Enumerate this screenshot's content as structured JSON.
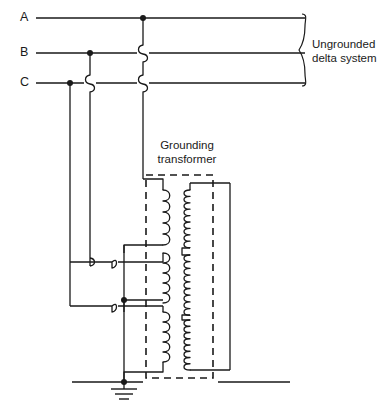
{
  "diagram": {
    "type": "electrical-schematic",
    "canvas": {
      "width": 390,
      "height": 406
    },
    "phases": [
      {
        "label": "A",
        "y": 18,
        "x_label": 22,
        "tap_x": 143
      },
      {
        "label": "B",
        "y": 53,
        "x_label": 22,
        "tap_x": 90
      },
      {
        "label": "C",
        "y": 83,
        "x_label": 22,
        "tap_x": 70
      }
    ],
    "bus": {
      "x_start": 36,
      "x_end": 305
    },
    "system_label": {
      "line1": "Ungrounded",
      "line2": "delta system"
    },
    "transformer_label": {
      "line1": "Grounding",
      "line2": "transformer"
    },
    "dashed_box": {
      "x": 146,
      "y": 175,
      "width": 67,
      "height": 203
    },
    "primary_coils": [
      {
        "name": "primary-winding-1",
        "x": 163,
        "y_top": 190,
        "y_bottom": 245,
        "turns": 5
      },
      {
        "name": "primary-winding-2",
        "x": 163,
        "y_top": 253,
        "y_bottom": 300,
        "turns": 5
      },
      {
        "name": "primary-winding-3",
        "x": 163,
        "y_top": 312,
        "y_bottom": 362,
        "turns": 5
      }
    ],
    "secondary_coils": [
      {
        "name": "secondary-winding-1",
        "x": 190,
        "y_top": 190,
        "y_bottom": 248,
        "turns": 9
      },
      {
        "name": "secondary-winding-2",
        "x": 190,
        "y_top": 255,
        "y_bottom": 315,
        "turns": 9
      },
      {
        "name": "secondary-winding-3",
        "x": 190,
        "y_top": 320,
        "y_bottom": 370,
        "turns": 8
      }
    ],
    "junction_dots": [
      {
        "name": "junction-phase-a",
        "x": 143,
        "y": 18
      },
      {
        "name": "junction-phase-b",
        "x": 90,
        "y": 53
      },
      {
        "name": "junction-phase-c",
        "x": 70,
        "y": 83
      },
      {
        "name": "junction-mid-tap",
        "x": 124,
        "y": 300
      },
      {
        "name": "junction-neutral",
        "x": 124,
        "y": 380
      }
    ],
    "ground_symbol": {
      "name": "earth-ground",
      "x": 124,
      "y": 382,
      "bar_widths": [
        26,
        17,
        9
      ]
    },
    "ground_bus": {
      "y": 382,
      "x_start": 72,
      "x_end": 290
    },
    "colors": {
      "line": "#1a1a1a",
      "background": "#ffffff"
    }
  }
}
